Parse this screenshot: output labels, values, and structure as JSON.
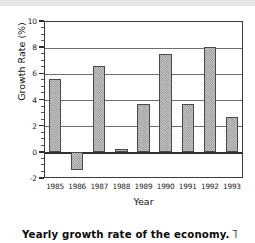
{
  "figure": {
    "caption_bold": "Yearly growth rate of the economy.",
    "caption_rest": "This"
  },
  "chart_data": {
    "type": "bar",
    "title": "",
    "xlabel": "Year",
    "ylabel": "Growth Rate (%)",
    "categories": [
      "1985",
      "1986",
      "1987",
      "1988",
      "1989",
      "1990",
      "1991",
      "1992",
      "1993"
    ],
    "values": [
      5.6,
      -1.4,
      6.55,
      0.2,
      3.65,
      7.45,
      3.65,
      8.0,
      2.65
    ],
    "ylim": [
      -2,
      10
    ],
    "ytick_labels": [
      "10",
      "8",
      "6",
      "4",
      "2",
      "0",
      "-2"
    ],
    "ytick_values": [
      10,
      8,
      6,
      4,
      2,
      0,
      -2
    ],
    "yminor_step": 0.5,
    "grid": "horizontal",
    "legend": "none",
    "bar_fill": "#c9c9c9",
    "bar_hatch": "#8e8e8e",
    "bar_edge": "#4a4a4a",
    "axis_color": "#3b3b3b"
  }
}
